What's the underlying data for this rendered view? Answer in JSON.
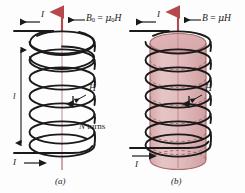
{
  "figure": {
    "background_color": "#fdfdfd",
    "width": 245,
    "height": 193
  },
  "colors": {
    "wire": "#1a1a1a",
    "field_arrow": "#b5484c",
    "axis_line": "#c08a8c",
    "core_fill": "#e2bcbd",
    "core_fill_top": "#dfb1b3",
    "core_edge": "#a9676a",
    "core_dash": "#8e4f52",
    "text": "#1a1a1a",
    "page": "#fdfdfd"
  },
  "panels": [
    {
      "id": "a",
      "caption": "(a)",
      "description": "Air-core solenoid",
      "turns_count": 7,
      "has_core": false,
      "labels": {
        "current_top": "I",
        "current_bottom": "I",
        "field_equation_lhs": "B",
        "field_equation_sub": "0",
        "field_equation_rhs_mu": "μ",
        "field_equation_rhs_sub": "0",
        "field_equation_rhs_h": "H",
        "field_equation_full": "B₀ = μ₀H",
        "h_label": "H",
        "length_label": "l",
        "turns_label_n": "N",
        "turns_label_word": "turns",
        "turns_label_full": "N turns"
      }
    },
    {
      "id": "b",
      "caption": "(b)",
      "description": "Solenoid with magnetic core",
      "turns_count": 7,
      "has_core": true,
      "labels": {
        "current_top": "I",
        "current_bottom": "I",
        "field_equation_lhs": "B",
        "field_equation_rhs_mu": "μ",
        "field_equation_rhs_h": "H",
        "field_equation_full": "B = μH",
        "h_label": "H"
      }
    }
  ]
}
